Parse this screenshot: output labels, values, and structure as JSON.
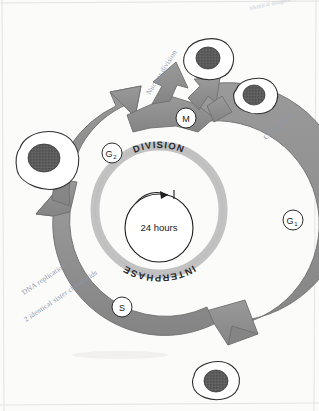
{
  "diagram": {
    "center": {
      "duration_label": "24 hours"
    },
    "ring_labels": {
      "outer_top": "DIVISION",
      "outer_bottom": "INTERPHASE"
    },
    "phases": [
      {
        "id": "M",
        "letter": "M",
        "subscript": "",
        "angle_deg": -90,
        "name": "m-phase"
      },
      {
        "id": "G1",
        "letter": "G",
        "subscript": "1",
        "angle_deg": 0,
        "name": "g1-phase"
      },
      {
        "id": "S",
        "letter": "S",
        "subscript": "",
        "angle_deg": 115,
        "name": "s-phase"
      },
      {
        "id": "G2",
        "letter": "G",
        "subscript": "2",
        "angle_deg": 205,
        "name": "g2-phase"
      }
    ],
    "annotations": [
      {
        "id": "nuclear-division",
        "text": "Nuclear division",
        "x": 150,
        "y": 95,
        "rotate": -58
      },
      {
        "id": "cell-growth",
        "text": "Cell growth",
        "x": 266,
        "y": 140,
        "rotate": -42
      },
      {
        "id": "dna-replication",
        "text": "DNA replication",
        "x": 24,
        "y": 295,
        "rotate": -34
      },
      {
        "id": "sister-chromatids",
        "text": "2 identical sister chromatids",
        "x": 30,
        "y": 320,
        "rotate": -34
      },
      {
        "id": "margin-note",
        "text": "identical daughter cells",
        "x": 252,
        "y": 10,
        "rotate": -12
      }
    ],
    "cells": [
      {
        "id": "cell-daughter-upper-left",
        "name": "daughter-cell-upper-left",
        "cx": 45,
        "cy": 160,
        "rx": 30,
        "ry": 25,
        "nucleus_r": 14
      },
      {
        "id": "cell-daughter-top",
        "name": "daughter-cell-top",
        "cx": 208,
        "cy": 58,
        "rx": 24,
        "ry": 19,
        "nucleus_r": 11
      },
      {
        "id": "cell-daughter-top-right",
        "name": "daughter-cell-top-right",
        "cx": 255,
        "cy": 95,
        "rx": 21,
        "ry": 17,
        "nucleus_r": 10
      },
      {
        "id": "cell-parent-bottom",
        "name": "parent-cell-bottom",
        "cx": 216,
        "cy": 381,
        "rx": 23,
        "ry": 19,
        "nucleus_r": 11
      }
    ],
    "colors": {
      "arrow_ring": "#8f8f8f",
      "arrow_ring_stroke": "#6f6f6f",
      "inner_ring": "#c0c0c0",
      "inner_ring_stroke": "#a8a8a8",
      "nucleus": "#585858",
      "cell_outline": "#2f2f2f",
      "text": "#1a1a1a",
      "handwriting": "#8d97ad",
      "paper": "#fbfbfa"
    }
  }
}
